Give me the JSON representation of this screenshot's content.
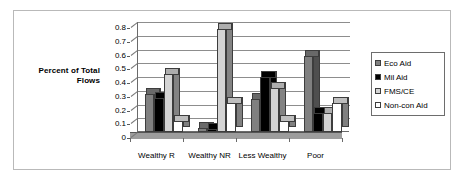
{
  "figure": {
    "axis_title_line1": "Percent of Total",
    "axis_title_line2": "Flows"
  },
  "legend": {
    "position": "right",
    "items": [
      {
        "label": "Eco Aid",
        "color": "#808080"
      },
      {
        "label": "Mil Aid",
        "color": "#000000"
      },
      {
        "label": "FMS/CE",
        "color": "#d4d4d4"
      },
      {
        "label": "Non-con Aid",
        "color": "#ffffff"
      }
    ]
  },
  "chart_data": {
    "type": "bar",
    "title": "",
    "subtitle": "",
    "xlabel": "",
    "ylabel": "Percent of Total Flows",
    "ylim": [
      0,
      0.8
    ],
    "ytick_step": 0.1,
    "yticks": [
      "0",
      "0.1",
      "0.2",
      "0.3",
      "0.4",
      "0.5",
      "0.6",
      "0.7",
      "0.8"
    ],
    "grid": true,
    "legend_position": "right",
    "three_d": true,
    "categories": [
      "Wealthy R",
      "Wealthy NR",
      "Less Wealthy",
      "Poor"
    ],
    "series": [
      {
        "name": "Eco Aid",
        "color": "#808080",
        "values": [
          0.28,
          0.03,
          0.24,
          0.55
        ]
      },
      {
        "name": "Mil Aid",
        "color": "#000000",
        "values": [
          0.25,
          0.02,
          0.4,
          0.14
        ]
      },
      {
        "name": "FMS/CE",
        "color": "#d4d4d4",
        "values": [
          0.42,
          0.75,
          0.32,
          0.14
        ]
      },
      {
        "name": "Non-con Aid",
        "color": "#ffffff",
        "values": [
          0.08,
          0.21,
          0.08,
          0.21
        ]
      }
    ]
  }
}
